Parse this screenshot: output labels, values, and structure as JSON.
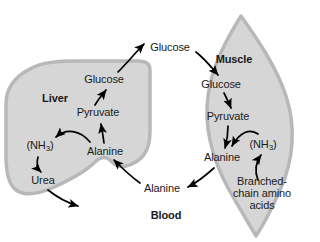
{
  "figure": {
    "background_color": "#ffffff",
    "organ_fill_color": "#d6d6d6",
    "organ_edge_color": "#b0b0b0",
    "text_color": "#1a1a1a",
    "arrow_color": "#000000"
  },
  "compartments": [
    {
      "id": "liver",
      "label": "Liver",
      "bold": true,
      "x": 55,
      "y": 99
    },
    {
      "id": "muscle",
      "label": "Muscle",
      "bold": true,
      "x": 234,
      "y": 60
    },
    {
      "id": "blood",
      "label": "Blood",
      "bold": true,
      "x": 166,
      "y": 216
    }
  ],
  "nodes": [
    {
      "id": "blood-glucose",
      "label": "Glucose",
      "x": 170,
      "y": 48,
      "compartment": "blood"
    },
    {
      "id": "liver-glucose",
      "label": "Glucose",
      "x": 104,
      "y": 80,
      "compartment": "liver"
    },
    {
      "id": "liver-pyruvate",
      "label": "Pyruvate",
      "x": 98,
      "y": 113,
      "compartment": "liver"
    },
    {
      "id": "liver-alanine",
      "label": "Alanine",
      "x": 105,
      "y": 152,
      "compartment": "liver"
    },
    {
      "id": "liver-ammonia",
      "label": "(NH3)",
      "x": 40,
      "y": 147,
      "compartment": "liver",
      "formula": true
    },
    {
      "id": "liver-urea",
      "label": "Urea",
      "x": 43,
      "y": 181,
      "compartment": "liver"
    },
    {
      "id": "muscle-glucose",
      "label": "Glucose",
      "x": 221,
      "y": 85,
      "compartment": "muscle"
    },
    {
      "id": "muscle-pyruvate",
      "label": "Pyruvate",
      "x": 228,
      "y": 117,
      "compartment": "muscle"
    },
    {
      "id": "muscle-alanine",
      "label": "Alanine",
      "x": 222,
      "y": 158,
      "compartment": "muscle"
    },
    {
      "id": "muscle-ammonia",
      "label": "(NH3)",
      "x": 263,
      "y": 146,
      "compartment": "muscle",
      "formula": true
    },
    {
      "id": "muscle-bcaa",
      "label": "Branched-chain amino acids",
      "x": 262,
      "y": 194,
      "compartment": "muscle",
      "multiline": true
    },
    {
      "id": "blood-alanine",
      "label": "Alanine",
      "x": 162,
      "y": 189,
      "compartment": "blood"
    }
  ],
  "edges": [
    {
      "id": "liver-pyruvate-to-glucose",
      "from": "liver-pyruvate",
      "to": "liver-glucose"
    },
    {
      "id": "liver-glucose-to-blood",
      "from": "liver-glucose",
      "to": "blood-glucose"
    },
    {
      "id": "blood-glucose-to-muscle",
      "from": "blood-glucose",
      "to": "muscle-glucose"
    },
    {
      "id": "muscle-glucose-to-pyruvate",
      "from": "muscle-glucose",
      "to": "muscle-pyruvate"
    },
    {
      "id": "muscle-pyruvate-to-alanine",
      "from": "muscle-pyruvate",
      "to": "muscle-alanine"
    },
    {
      "id": "muscle-ammonia-to-alanine",
      "from": "muscle-ammonia",
      "to": "muscle-alanine"
    },
    {
      "id": "muscle-bcaa-to-ammonia",
      "from": "muscle-bcaa",
      "to": "muscle-ammonia"
    },
    {
      "id": "muscle-alanine-to-blood",
      "from": "muscle-alanine",
      "to": "blood-alanine"
    },
    {
      "id": "blood-alanine-to-liver",
      "from": "blood-alanine",
      "to": "liver-alanine"
    },
    {
      "id": "liver-alanine-to-pyruvate",
      "from": "liver-alanine",
      "to": "liver-pyruvate"
    },
    {
      "id": "liver-alanine-to-ammonia",
      "from": "liver-alanine",
      "to": "liver-ammonia"
    },
    {
      "id": "liver-ammonia-to-urea",
      "from": "liver-ammonia",
      "to": "liver-urea"
    },
    {
      "id": "liver-urea-excretion",
      "from": "liver-urea",
      "to": "excretion"
    }
  ]
}
